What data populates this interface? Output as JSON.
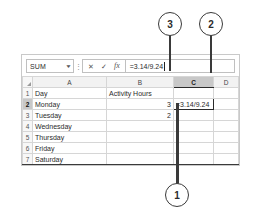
{
  "app": {
    "name": "spreadsheet-formula-bar-figure"
  },
  "formula_bar": {
    "name_box": {
      "value": "SUM",
      "dropdown_icon": "chevron-down-icon"
    },
    "separator_icon": "vertical-dots-icon",
    "cancel_icon": "✕",
    "enter_icon": "✓",
    "function_icon": "fx",
    "formula_value": "=3.14/9.24"
  },
  "grid": {
    "corner_icon": "select-all-triangle-icon",
    "columns": [
      "A",
      "B",
      "C",
      "D"
    ],
    "active_column": "C",
    "active_row": "2",
    "rows": [
      {
        "header": "1",
        "A": "Day",
        "B": "Activity Hours",
        "C": "",
        "D": ""
      },
      {
        "header": "2",
        "A": "Monday",
        "B": "3",
        "C": "=3.14/9.24",
        "D": ""
      },
      {
        "header": "3",
        "A": "Tuesday",
        "B": "2",
        "C": "",
        "D": ""
      },
      {
        "header": "4",
        "A": "Wednesday",
        "B": "",
        "C": "",
        "D": ""
      },
      {
        "header": "5",
        "A": "Thursday",
        "B": "",
        "C": "",
        "D": ""
      },
      {
        "header": "6",
        "A": "Friday",
        "B": "",
        "C": "",
        "D": ""
      },
      {
        "header": "7",
        "A": "Saturday",
        "B": "",
        "C": "",
        "D": ""
      }
    ]
  },
  "callouts": [
    {
      "id": "1",
      "label": "1"
    },
    {
      "id": "2",
      "label": "2"
    },
    {
      "id": "3",
      "label": "3"
    }
  ],
  "colors": {
    "callout_stroke": "#3a3a3a",
    "active_header": "#c8c8c8",
    "grid_line": "#d6d6d6",
    "panel_border": "#c9c9c9"
  }
}
